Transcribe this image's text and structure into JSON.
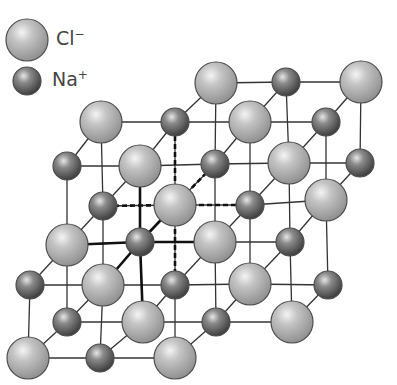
{
  "legend": {
    "items": [
      {
        "ion": "Cl",
        "charge": "−",
        "type": "anion",
        "cx": 27,
        "cy": 40,
        "r": 21,
        "label_x": 56,
        "label_y": 27
      },
      {
        "ion": "Na",
        "charge": "+",
        "type": "cation",
        "cx": 27,
        "cy": 81,
        "r": 14,
        "label_x": 52,
        "label_y": 68
      }
    ]
  },
  "colors": {
    "cl_light": "#e4e4e4",
    "cl_mid": "#b8b8b8",
    "cl_dark": "#8c8c8c",
    "na_light": "#c8c8c8",
    "na_mid": "#8a8a8a",
    "na_dark": "#4a4a4a",
    "outline": "#4d4d4d",
    "line": "#333333"
  },
  "radii": {
    "cl": 21,
    "na": 14
  },
  "ions": {
    "cl": [
      [
        216,
        83
      ],
      [
        361,
        82
      ],
      [
        101,
        122
      ],
      [
        250,
        122
      ],
      [
        140,
        166
      ],
      [
        289,
        163
      ],
      [
        175,
        205
      ],
      [
        326,
        200
      ],
      [
        67,
        245
      ],
      [
        215,
        242
      ],
      [
        103,
        285
      ],
      [
        250,
        284
      ],
      [
        143,
        322
      ],
      [
        292,
        322
      ],
      [
        28,
        358
      ],
      [
        175,
        358
      ]
    ],
    "na": [
      [
        286,
        82
      ],
      [
        175,
        122
      ],
      [
        326,
        122
      ],
      [
        67,
        166
      ],
      [
        215,
        164
      ],
      [
        360,
        163
      ],
      [
        103,
        206
      ],
      [
        250,
        205
      ],
      [
        140,
        242
      ],
      [
        290,
        242
      ],
      [
        30,
        285
      ],
      [
        175,
        285
      ],
      [
        328,
        285
      ],
      [
        67,
        322
      ],
      [
        216,
        322
      ],
      [
        100,
        358
      ]
    ]
  },
  "highlight": {
    "dashed_center": [
      175,
      205
    ],
    "dashed_to": [
      [
        175,
        122
      ],
      [
        103,
        206
      ],
      [
        250,
        205
      ],
      [
        215,
        164
      ],
      [
        175,
        285
      ]
    ],
    "thick_center": [
      140,
      242
    ],
    "thick_to": [
      [
        67,
        245
      ],
      [
        215,
        242
      ],
      [
        140,
        166
      ],
      [
        143,
        322
      ],
      [
        175,
        205
      ],
      [
        103,
        285
      ]
    ]
  }
}
